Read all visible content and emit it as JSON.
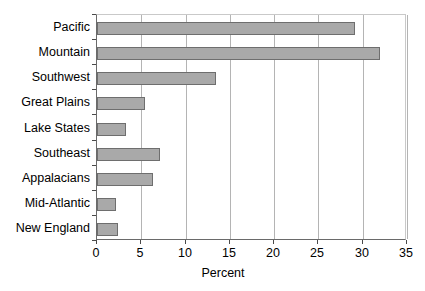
{
  "chart_data": {
    "type": "bar",
    "orientation": "horizontal",
    "title": "",
    "xlabel": "Percent",
    "ylabel": "",
    "xlim": [
      0,
      35
    ],
    "xticks": [
      0,
      5,
      10,
      15,
      20,
      25,
      30,
      35
    ],
    "xtick_labels": [
      "0",
      "5",
      "10",
      "15",
      "20",
      "25",
      "30",
      "35"
    ],
    "grid": "vertical",
    "legend": "none",
    "bar_color": "#a9a9a9",
    "bar_edge_color": "#6e6e6e",
    "categories": [
      "Pacific",
      "Mountain",
      "Southwest",
      "Great Plains",
      "Lake States",
      "Southeast",
      "Appalacians",
      "Mid-Atlantic",
      "New England"
    ],
    "values": [
      29.1,
      31.9,
      13.4,
      5.4,
      3.3,
      7.1,
      6.3,
      2.1,
      2.4
    ],
    "series": [
      {
        "name": "Percent",
        "values": [
          29.1,
          31.9,
          13.4,
          5.4,
          3.3,
          7.1,
          6.3,
          2.1,
          2.4
        ]
      }
    ]
  }
}
